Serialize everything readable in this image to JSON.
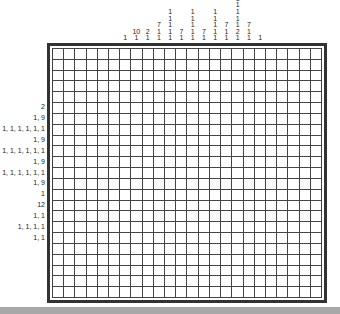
{
  "puzzle": {
    "type": "nonogram",
    "columns": 24,
    "rows": 23,
    "col_clues": [
      [],
      [],
      [],
      [],
      [],
      [],
      [
        "1"
      ],
      [
        "10",
        "1"
      ],
      [
        "2",
        "1"
      ],
      [
        "7",
        "1",
        "1"
      ],
      [
        "1",
        "1",
        "1",
        "1",
        "1"
      ],
      [
        "7",
        "1"
      ],
      [
        "1",
        "1",
        "1",
        "1",
        "1"
      ],
      [
        "7",
        "1"
      ],
      [
        "1",
        "1",
        "1",
        "1",
        "1"
      ],
      [
        "7",
        "1",
        "1"
      ],
      [
        "1",
        "1",
        "1",
        "1",
        "1",
        "2",
        "1"
      ],
      [
        "7",
        "1",
        "1"
      ],
      [
        "1"
      ],
      [],
      [],
      [],
      [],
      []
    ],
    "row_clues": [
      "",
      "",
      "",
      "",
      "",
      "2",
      "1, 9",
      "1, 1, 1, 1, 1, 1",
      "1, 9",
      "1, 1, 1, 1, 1, 1",
      "1, 9",
      "1, 1, 1, 1, 1, 1",
      "1, 9",
      "1",
      "12",
      "1, 1",
      "1, 1, 1, 1",
      "1, 1",
      "",
      "",
      "",
      "",
      ""
    ]
  },
  "colors": {
    "grid_line": "#444444",
    "border": "#333333",
    "footer": "#a8a8a8"
  }
}
